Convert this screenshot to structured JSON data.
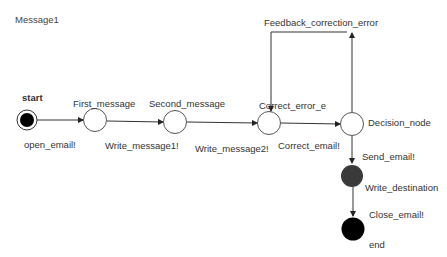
{
  "title": "Message1",
  "states": [
    {
      "id": "start",
      "label": "start",
      "type": "initial"
    },
    {
      "id": "first",
      "label": "First_message",
      "type": "state"
    },
    {
      "id": "second",
      "label": "Second_message",
      "type": "state"
    },
    {
      "id": "correct",
      "label": "Correct_error_e",
      "type": "state"
    },
    {
      "id": "decision",
      "label": "Decision_node",
      "type": "decision"
    },
    {
      "id": "write_dest",
      "label": "Write_destination",
      "type": "state"
    },
    {
      "id": "end",
      "label": "end",
      "type": "final"
    }
  ],
  "transitions": [
    {
      "from": "start",
      "to": "first",
      "label": "open_email!"
    },
    {
      "from": "first",
      "to": "second",
      "label": "Write_message1!"
    },
    {
      "from": "second",
      "to": "correct",
      "label": "Write_message2!"
    },
    {
      "from": "correct",
      "to": "decision",
      "label": "Correct_email!"
    },
    {
      "from": "decision",
      "to": "correct",
      "label": "Feedback_correction_error"
    },
    {
      "from": "decision",
      "to": "write_dest",
      "label": "Send_email!"
    },
    {
      "from": "write_dest",
      "to": "end",
      "label": "Close_email!"
    }
  ],
  "colors": {
    "line": "#333333",
    "initial_fill": "#000000",
    "write_dest_fill": "#3a3a3a",
    "end_fill": "#000000"
  }
}
